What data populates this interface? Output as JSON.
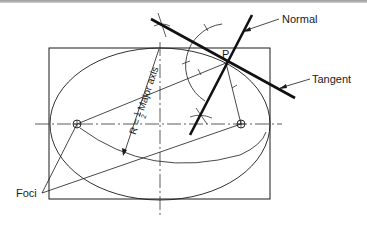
{
  "diagram": {
    "labels": {
      "normal": "Normal",
      "tangent": "Tangent",
      "foci": "Foci",
      "point": "P",
      "radius_prefix": "R = ",
      "radius_num": "1",
      "radius_den": "2",
      "radius_suffix": " Major axis"
    },
    "colors": {
      "line": "#1a1a1a",
      "topbar": "#a8a8a8",
      "background": "#ffffff"
    },
    "geometry": {
      "rectangle": {
        "x": 49,
        "y": 48,
        "w": 221,
        "h": 151
      },
      "ellipse": {
        "cx": 160,
        "cy": 124,
        "rx": 110,
        "ry": 76
      },
      "foci": [
        {
          "x": 77,
          "y": 124
        },
        {
          "x": 241,
          "y": 124
        }
      ],
      "point_P": {
        "x": 226,
        "y": 63
      },
      "tangent_line": {
        "x1": 151,
        "y1": 19,
        "x2": 295,
        "y2": 98
      },
      "normal_line": {
        "x1": 252,
        "y1": 15,
        "x2": 190,
        "y2": 135
      }
    }
  }
}
